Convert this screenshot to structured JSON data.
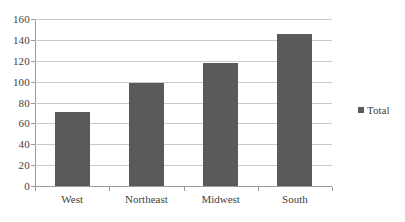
{
  "chart_data": {
    "type": "bar",
    "title": "",
    "subtitle": "",
    "xlabel": "",
    "ylabel": "",
    "categories": [
      "West",
      "Northeast",
      "Midwest",
      "South"
    ],
    "series": [
      {
        "name": "Total",
        "values": [
          71,
          99,
          118,
          146
        ],
        "color": "#5a5a5a"
      }
    ],
    "ylim": [
      0,
      160
    ],
    "yticks": [
      0,
      20,
      40,
      60,
      80,
      100,
      120,
      140,
      160
    ],
    "ytick_labels": [
      "0",
      "20",
      "40",
      "60",
      "80",
      "100",
      "120",
      "140",
      "160"
    ],
    "grid": {
      "horizontal": true,
      "vertical": false,
      "color": "#c9c9c9"
    },
    "legend": {
      "position": "right",
      "entries": [
        {
          "label": "Total",
          "marker": "square",
          "color": "#5a5a5a"
        }
      ]
    },
    "axes": {
      "y_axis_line_color": "#9a9a9a",
      "x_axis_line_color": "#9a9a9a",
      "tick_marks": true
    },
    "background_color": "#ffffff"
  }
}
